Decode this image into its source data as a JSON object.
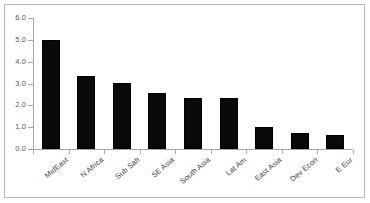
{
  "chart_data": {
    "type": "bar",
    "title": "",
    "subtitle": "",
    "xlabel": "",
    "ylabel": "",
    "categories": [
      "MidEast",
      "N Africa",
      "Sub Sah",
      "SE Asia",
      "South Asia",
      "Lat Am",
      "East Asia",
      "Dev Econ",
      "E Eur"
    ],
    "values": [
      5.0,
      3.35,
      3.02,
      2.55,
      2.33,
      2.33,
      1.03,
      0.72,
      0.62
    ],
    "ylim": [
      0.0,
      6.0
    ],
    "yticks": [
      0.0,
      1.0,
      2.0,
      3.0,
      4.0,
      5.0,
      6.0
    ],
    "ytick_labels": [
      "0.0",
      "1.0",
      "2.0",
      "3.0",
      "4.0",
      "5.0",
      "6.0"
    ],
    "grid": false,
    "legend": null,
    "legend_position": "none",
    "bar_color": "#0a0a0a",
    "axis_color": "#a6a6a6",
    "border_color": "#b9b9b9",
    "label_color": "#3c3c3c",
    "tick_label_color": "#5a5a5a",
    "x_label_rotation": -40
  }
}
